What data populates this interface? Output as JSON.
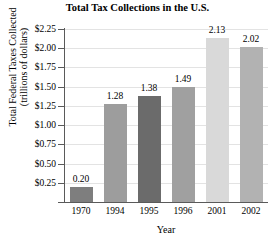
{
  "chart_data": {
    "type": "bar",
    "title": "Total Tax Collections in the U.S.",
    "xlabel": "Year",
    "ylabel_lines": [
      "Total Federal Taxes Collected",
      "(trillions of dollars)"
    ],
    "ylabel": "Total Federal Taxes Collected (trillions of dollars)",
    "categories": [
      "1970",
      "1994",
      "1995",
      "1996",
      "2001",
      "2002"
    ],
    "values": [
      0.2,
      1.28,
      1.38,
      1.49,
      2.13,
      2.02
    ],
    "value_labels": [
      "0.20",
      "1.28",
      "1.38",
      "1.49",
      "2.13",
      "2.02"
    ],
    "bar_colors": [
      "#7e7e7e",
      "#9d9d9d",
      "#6b6b6b",
      "#a0a0a0",
      "#d9d9d9",
      "#b2b2b2"
    ],
    "ylim": [
      0,
      2.25
    ],
    "ytick_values": [
      0.25,
      0.5,
      0.75,
      1.0,
      1.25,
      1.5,
      1.75,
      2.0,
      2.25
    ],
    "ytick_labels": [
      "$0.25",
      "$0.50",
      "$0.75",
      "$1.00",
      "$1.25",
      "$1.50",
      "$1.75",
      "$2.00",
      "$2.25"
    ],
    "grid": true,
    "legend": false,
    "axis_color": "#5a5a5a",
    "gridline_color": "#e3e3e3"
  }
}
